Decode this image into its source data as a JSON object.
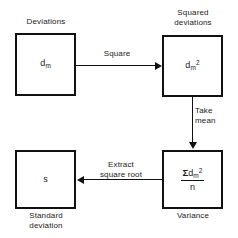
{
  "diagram": {
    "colors": {
      "background": "#ffffff",
      "stroke": "#111111",
      "text": "#1a1a1a"
    },
    "nodes": [
      {
        "id": "deviations",
        "caption": "Deviations",
        "caption_position": "above",
        "symbol_base": "d",
        "symbol_sub": "m",
        "symbol_sup": ""
      },
      {
        "id": "squared-deviations",
        "caption": "Squared\ndeviations",
        "caption_position": "above",
        "symbol_base": "d",
        "symbol_sub": "m",
        "symbol_sup": "2"
      },
      {
        "id": "variance",
        "caption": "Variance",
        "caption_position": "below",
        "numerator_sigma": "Σ",
        "numerator_base": "d",
        "numerator_sub": "m",
        "numerator_sup": "2",
        "denominator": "n"
      },
      {
        "id": "standard-deviation",
        "caption": "Standard\ndeviation",
        "caption_position": "below",
        "symbol_base": "s",
        "symbol_sub": "",
        "symbol_sup": ""
      }
    ],
    "connectors": [
      {
        "id": "square",
        "label": "Square",
        "from": "deviations",
        "to": "squared-deviations",
        "direction": "right"
      },
      {
        "id": "take-mean",
        "label": "Take\nmean",
        "from": "squared-deviations",
        "to": "variance",
        "direction": "down"
      },
      {
        "id": "extract-square-root",
        "label": "Extract\nsquare root",
        "from": "variance",
        "to": "standard-deviation",
        "direction": "left"
      }
    ]
  }
}
